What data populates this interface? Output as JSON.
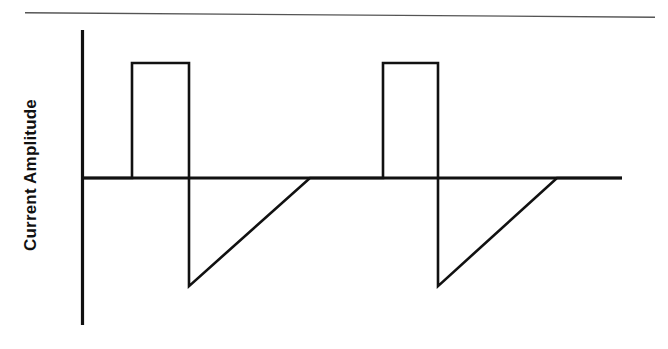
{
  "chart_data": {
    "type": "line",
    "title": "",
    "subtitle": "",
    "xlabel": "",
    "ylabel": "Current Amplitude",
    "series": [
      {
        "name": "current-waveform",
        "description": "Biphasic stimulation waveform: rectangular positive pulse followed by an exponentially-decaying-like negative triangular recharge ramp, repeated twice.",
        "points": [
          {
            "x": 0,
            "y": 0
          },
          {
            "x": 50,
            "y": 0
          },
          {
            "x": 50,
            "y": 1.0
          },
          {
            "x": 107,
            "y": 1.0
          },
          {
            "x": 107,
            "y": -0.94
          },
          {
            "x": 228,
            "y": 0
          },
          {
            "x": 301,
            "y": 0
          },
          {
            "x": 301,
            "y": 1.0
          },
          {
            "x": 356,
            "y": 1.0
          },
          {
            "x": 356,
            "y": -0.94
          },
          {
            "x": 475,
            "y": 0
          },
          {
            "x": 540,
            "y": 0
          }
        ]
      }
    ],
    "xlim": [
      0,
      540
    ],
    "ylim": [
      -1.25,
      1.42
    ],
    "grid": false,
    "legend": null,
    "legend_position": "none",
    "axes": {
      "y_axis_visible": true,
      "x_axis_visible": true,
      "x_tick_labels": [],
      "y_tick_labels": [],
      "zero_line": true
    },
    "annotations": [
      {
        "name": "upper-reference-line",
        "type": "horizontal-rule",
        "y": 1.42,
        "style": "thin",
        "label": ""
      }
    ]
  },
  "figure": {
    "background_color": "#ffffff",
    "stroke_color": "#111111",
    "reference_line_color": "#555555"
  }
}
